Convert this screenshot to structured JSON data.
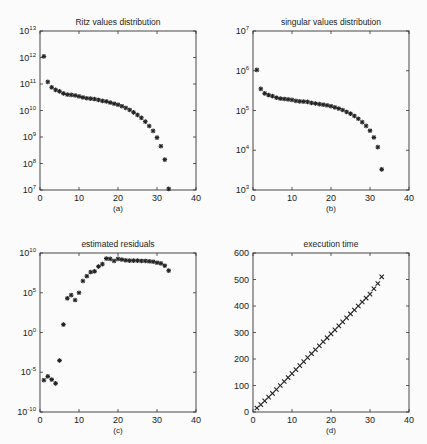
{
  "chart_data": [
    {
      "type": "scatter",
      "title": "Ritz values distribution",
      "caption": "(a)",
      "xlabel": "",
      "ylabel": "",
      "xlim": [
        0,
        40
      ],
      "ylim": [
        10000000.0,
        10000000000000.0
      ],
      "yscale": "log",
      "xticks": [
        "0",
        "10",
        "20",
        "30",
        "40"
      ],
      "yticks": [
        "10^7",
        "10^8",
        "10^9",
        "10^10",
        "10^11",
        "10^12",
        "10^13"
      ],
      "marker": "*",
      "x": [
        1,
        2,
        3,
        4,
        5,
        6,
        7,
        8,
        9,
        10,
        11,
        12,
        13,
        14,
        15,
        16,
        17,
        18,
        19,
        20,
        21,
        22,
        23,
        24,
        25,
        26,
        27,
        28,
        29,
        30,
        31,
        32,
        33
      ],
      "values": [
        1100000000000.0,
        120000000000.0,
        75000000000.0,
        60000000000.0,
        53000000000.0,
        44000000000.0,
        40000000000.0,
        39000000000.0,
        37000000000.0,
        34000000000.0,
        31000000000.0,
        29000000000.0,
        28000000000.0,
        27000000000.0,
        25000000000.0,
        23000000000.0,
        22000000000.0,
        20000000000.0,
        18000000000.0,
        16500000000.0,
        14500000000.0,
        12500000000.0,
        10500000000.0,
        8500000000.0,
        6800000000.0,
        5300000000.0,
        3800000000.0,
        2600000000.0,
        1700000000.0,
        950000000.0,
        450000000.0,
        140000000.0,
        11000000.0
      ]
    },
    {
      "type": "scatter",
      "title": "singular values distribution",
      "caption": "(b)",
      "xlabel": "",
      "ylabel": "",
      "xlim": [
        0,
        40
      ],
      "ylim": [
        1000.0,
        10000000.0
      ],
      "yscale": "log",
      "xticks": [
        "0",
        "10",
        "20",
        "30",
        "40"
      ],
      "yticks": [
        "10^3",
        "10^4",
        "10^5",
        "10^6",
        "10^7"
      ],
      "marker": "*",
      "x": [
        1,
        2,
        3,
        4,
        5,
        6,
        7,
        8,
        9,
        10,
        11,
        12,
        13,
        14,
        15,
        16,
        17,
        18,
        19,
        20,
        21,
        22,
        23,
        24,
        25,
        26,
        27,
        28,
        29,
        30,
        31,
        32,
        33
      ],
      "values": [
        1050000.0,
        350000.0,
        270000.0,
        245000.0,
        230000.0,
        210000.0,
        200000.0,
        195000.0,
        190000.0,
        185000.0,
        175000.0,
        170000.0,
        168000.0,
        165000.0,
        155000.0,
        150000.0,
        145000.0,
        140000.0,
        135000.0,
        128000.0,
        120000.0,
        112000.0,
        103000.0,
        92000.0,
        83000.0,
        73000.0,
        62000.0,
        51000.0,
        41000.0,
        31000.0,
        21000.0,
        12000.0,
        3300.0
      ]
    },
    {
      "type": "scatter",
      "title": "estimated residuals",
      "caption": "(c)",
      "xlabel": "",
      "ylabel": "",
      "xlim": [
        0,
        40
      ],
      "ylim": [
        1e-10,
        10000000000.0
      ],
      "yscale": "log",
      "xticks": [
        "0",
        "10",
        "20",
        "30",
        "40"
      ],
      "yticks": [
        "10^-10",
        "10^-5",
        "10^0",
        "10^5",
        "10^10"
      ],
      "marker": "*",
      "x": [
        1,
        2,
        3,
        4,
        5,
        6,
        7,
        8,
        9,
        10,
        11,
        12,
        13,
        14,
        15,
        16,
        17,
        18,
        19,
        20,
        21,
        22,
        23,
        24,
        25,
        26,
        27,
        28,
        29,
        30,
        31,
        32,
        33
      ],
      "values": [
        1e-06,
        3e-06,
        1.2e-06,
        4e-07,
        0.0003,
        10.0,
        20000.0,
        50000.0,
        12000.0,
        100000.0,
        3000000.0,
        12000000.0,
        40000000.0,
        50000000.0,
        200000000.0,
        400000000.0,
        2000000000.0,
        1800000000.0,
        1000000000.0,
        1800000000.0,
        1500000000.0,
        1200000000.0,
        1100000000.0,
        1100000000.0,
        1100000000.0,
        1000000000.0,
        1000000000.0,
        900000000.0,
        800000000.0,
        600000000.0,
        500000000.0,
        250000000.0,
        60000000.0
      ]
    },
    {
      "type": "scatter",
      "title": "execution time",
      "caption": "(d)",
      "xlabel": "",
      "ylabel": "",
      "xlim": [
        0,
        40
      ],
      "ylim": [
        0,
        600
      ],
      "yscale": "linear",
      "xticks": [
        "0",
        "10",
        "20",
        "30",
        "40"
      ],
      "yticks": [
        "0",
        "100",
        "200",
        "300",
        "400",
        "500",
        "600"
      ],
      "marker": "x",
      "x": [
        1,
        2,
        3,
        4,
        5,
        6,
        7,
        8,
        9,
        10,
        11,
        12,
        13,
        14,
        15,
        16,
        17,
        18,
        19,
        20,
        21,
        22,
        23,
        24,
        25,
        26,
        27,
        28,
        29,
        30,
        31,
        32,
        33
      ],
      "values": [
        15,
        28,
        42,
        56,
        70,
        85,
        100,
        115,
        130,
        145,
        160,
        175,
        190,
        205,
        220,
        235,
        250,
        265,
        280,
        295,
        310,
        325,
        340,
        355,
        370,
        385,
        400,
        415,
        430,
        445,
        465,
        485,
        510
      ]
    }
  ]
}
